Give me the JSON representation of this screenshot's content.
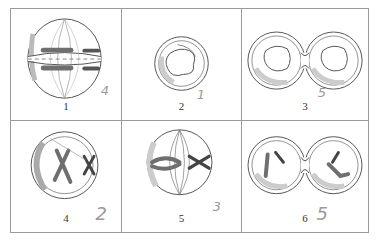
{
  "figure": {
    "colors": {
      "border": "#9a9a9a",
      "line": "#555555",
      "chromosome": "#6f6f6f",
      "shading": "#cfcfcf",
      "pencil": "#9a9a9a"
    },
    "cells": [
      {
        "label": "1",
        "stage": "telophase-cleavage",
        "handwritten": "4"
      },
      {
        "label": "2",
        "stage": "interphase-nucleus",
        "handwritten": "1"
      },
      {
        "label": "3",
        "stage": "two-daughter-cells-interphase",
        "handwritten": "5"
      },
      {
        "label": "4",
        "stage": "prophase-chromosomes",
        "handwritten": "2"
      },
      {
        "label": "5",
        "stage": "metaphase-spindle",
        "handwritten": "3"
      },
      {
        "label": "6",
        "stage": "two-daughter-cells-chromosomes",
        "handwritten": "5"
      }
    ]
  }
}
